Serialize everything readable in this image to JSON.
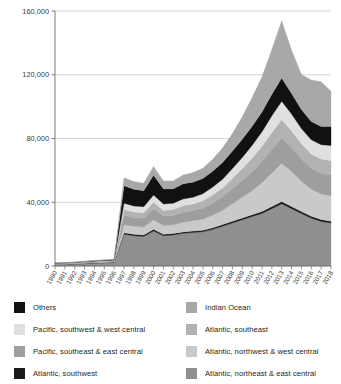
{
  "chart_data": {
    "type": "area",
    "stacked": true,
    "title": "",
    "subtitle": "",
    "xlabel": "",
    "ylabel": "",
    "grid": true,
    "legend_position": "bottom",
    "ylim": [
      0,
      160000
    ],
    "yticks": [
      0,
      40000,
      80000,
      120000,
      160000
    ],
    "ytick_labels": [
      "0",
      "40,000",
      "80,000",
      "120,000",
      "160,000"
    ],
    "x": [
      1990,
      1991,
      1992,
      1993,
      1994,
      1995,
      1996,
      1997,
      1998,
      1999,
      2000,
      2001,
      2002,
      2003,
      2004,
      2005,
      2006,
      2007,
      2008,
      2009,
      2010,
      2011,
      2012,
      2013,
      2014,
      2015,
      2016,
      2017,
      2018
    ],
    "xtick_labels": [
      "1990",
      "1991",
      "1992",
      "1993",
      "1994",
      "1995",
      "1996",
      "1997",
      "1998",
      "1999",
      "2000",
      "2001",
      "2002",
      "2003",
      "2004",
      "2005",
      "2006",
      "2007",
      "2008",
      "2009",
      "2010",
      "2011",
      "2012",
      "2013",
      "2014",
      "2015",
      "2016",
      "2017",
      "2018"
    ],
    "series": [
      {
        "name": "Atlantic, northeast & east central",
        "color": "#8f8f8f",
        "values": [
          900,
          1000,
          1200,
          1500,
          1800,
          2000,
          2200,
          20000,
          19000,
          18500,
          22000,
          19000,
          19500,
          20500,
          21000,
          21500,
          23000,
          25000,
          27000,
          29000,
          31000,
          33000,
          36000,
          39000,
          36000,
          33000,
          30000,
          28000,
          27000
        ]
      },
      {
        "name": "Atlantic, southwest",
        "color": "#1a1a1a",
        "values": [
          150,
          160,
          180,
          200,
          220,
          240,
          260,
          900,
          900,
          900,
          1000,
          900,
          900,
          900,
          900,
          900,
          1000,
          1000,
          1100,
          1100,
          1200,
          1200,
          1300,
          1400,
          1300,
          1200,
          1200,
          1100,
          1100
        ]
      },
      {
        "name": "Atlantic, northwest & west central",
        "color": "#c9c9c9",
        "values": [
          200,
          220,
          250,
          300,
          350,
          380,
          400,
          5000,
          5000,
          5000,
          6000,
          5500,
          5500,
          6000,
          6500,
          7000,
          8000,
          9000,
          11000,
          13000,
          15000,
          18000,
          21000,
          24000,
          22000,
          19000,
          17000,
          16000,
          16000
        ]
      },
      {
        "name": "Pacific, southeast & east central",
        "color": "#9e9e9e",
        "values": [
          200,
          220,
          250,
          280,
          320,
          350,
          380,
          6000,
          5500,
          5500,
          7000,
          6000,
          6000,
          6500,
          6500,
          7000,
          7500,
          8500,
          9500,
          10500,
          12000,
          13500,
          15000,
          16000,
          15000,
          14000,
          13000,
          13000,
          13000
        ]
      },
      {
        "name": "Atlantic, southeast",
        "color": "#b2b2b2",
        "values": [
          120,
          130,
          150,
          170,
          190,
          210,
          230,
          3500,
          3500,
          3500,
          4000,
          3500,
          3500,
          4000,
          4000,
          4500,
          5000,
          5500,
          6500,
          7500,
          8500,
          9500,
          10500,
          11500,
          10500,
          9500,
          9000,
          9000,
          9000
        ]
      },
      {
        "name": "Pacific, southwest & west central",
        "color": "#e0e0e0",
        "values": [
          100,
          110,
          120,
          140,
          160,
          180,
          200,
          4000,
          3800,
          3800,
          4500,
          4000,
          4000,
          4200,
          4200,
          4500,
          5000,
          5500,
          6000,
          7000,
          8000,
          9000,
          10500,
          11500,
          10500,
          9500,
          9000,
          9000,
          9500
        ]
      },
      {
        "name": "Others",
        "color": "#111111",
        "values": [
          150,
          160,
          180,
          200,
          230,
          260,
          280,
          11000,
          10500,
          10000,
          12500,
          9500,
          9000,
          9500,
          9500,
          9500,
          10000,
          10500,
          11000,
          11500,
          12000,
          12500,
          13500,
          14500,
          13000,
          12000,
          11500,
          11500,
          12000
        ]
      },
      {
        "name": "Indian Ocean",
        "color": "#a8a8a8",
        "values": [
          180,
          200,
          230,
          260,
          300,
          330,
          360,
          5000,
          4800,
          4800,
          5500,
          5000,
          5000,
          5500,
          6000,
          6500,
          7500,
          9000,
          11000,
          14000,
          18000,
          22000,
          28000,
          36000,
          27000,
          22000,
          26000,
          28000,
          22000
        ]
      }
    ]
  },
  "legend": {
    "left_column": [
      {
        "label": "Others",
        "color": "#111111"
      },
      {
        "label": "Pacific, southwest & west central",
        "color": "#e0e0e0"
      },
      {
        "label": "Pacific, southeast & east central",
        "color": "#9e9e9e"
      },
      {
        "label": "Atlantic, southwest",
        "color": "#1a1a1a"
      }
    ],
    "right_column": [
      {
        "label": "Indian Ocean",
        "color": "#a8a8a8"
      },
      {
        "label": "Atlantic, southeast",
        "color": "#b2b2b2"
      },
      {
        "label": "Atlantic, northwest & west central",
        "color": "#c9c9c9"
      },
      {
        "label": "Atlantic, northeast & east central",
        "color": "#8f8f8f"
      }
    ]
  }
}
